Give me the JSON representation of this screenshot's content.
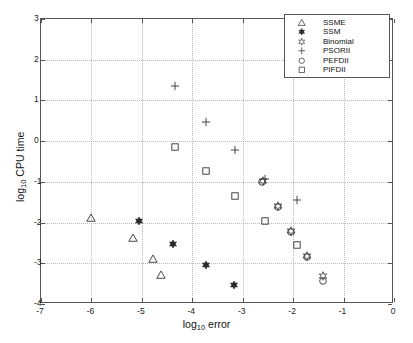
{
  "chart_data": {
    "type": "scatter",
    "title": "",
    "xlabel": "log10 error",
    "ylabel": "log10 CPU time",
    "xlabel_parts": {
      "pre": "log",
      "sub": "10",
      "post": " error"
    },
    "ylabel_parts": {
      "pre": "log",
      "sub": "10",
      "post": " CPU time"
    },
    "xlim": [
      -7,
      0
    ],
    "ylim": [
      -4,
      3
    ],
    "xticks": [
      -7,
      -6,
      -5,
      -4,
      -3,
      -2,
      -1,
      0
    ],
    "xticklabels": [
      "-7",
      "-6",
      "-5",
      "-4",
      "-3",
      "-2",
      "-1",
      "0"
    ],
    "yticks": [
      -4,
      -3,
      -2,
      -1,
      0,
      1,
      2,
      3
    ],
    "yticklabels": [
      "-4",
      "-3",
      "-2",
      "-1",
      "0",
      "1",
      "2",
      "3"
    ],
    "grid": true,
    "grid_style": "dotted",
    "legend_position": "upper right",
    "series": [
      {
        "name": "SSME",
        "marker": "triangle",
        "fill": "none",
        "color": "#333333",
        "points": [
          {
            "x": -6.0,
            "y": -1.89
          },
          {
            "x": -5.18,
            "y": -2.38
          },
          {
            "x": -4.78,
            "y": -2.89
          },
          {
            "x": -4.62,
            "y": -3.29
          }
        ]
      },
      {
        "name": "SSM",
        "marker": "filled-dot",
        "fill": "#2b2b2b",
        "color": "#2b2b2b",
        "points": [
          {
            "x": -5.06,
            "y": -1.97
          },
          {
            "x": -4.38,
            "y": -2.52
          },
          {
            "x": -3.72,
            "y": -3.04
          },
          {
            "x": -3.17,
            "y": -3.54
          }
        ]
      },
      {
        "name": "Binomial",
        "marker": "star",
        "fill": "none",
        "color": "#333333",
        "points": [
          {
            "x": -2.6,
            "y": -0.99
          },
          {
            "x": -2.3,
            "y": -1.6
          },
          {
            "x": -2.04,
            "y": -2.21
          },
          {
            "x": -1.72,
            "y": -2.83
          },
          {
            "x": -1.4,
            "y": -3.32
          }
        ]
      },
      {
        "name": "PSORII",
        "marker": "plus",
        "fill": "none",
        "color": "#333333",
        "points": [
          {
            "x": -4.34,
            "y": 1.35
          },
          {
            "x": -3.72,
            "y": 0.47
          },
          {
            "x": -3.16,
            "y": -0.21
          },
          {
            "x": -2.56,
            "y": -0.93
          },
          {
            "x": -1.92,
            "y": -1.45
          }
        ]
      },
      {
        "name": "PEFDII",
        "marker": "circle",
        "fill": "none",
        "color": "#333333",
        "points": [
          {
            "x": -2.61,
            "y": -1.0
          },
          {
            "x": -2.31,
            "y": -1.61
          },
          {
            "x": -2.05,
            "y": -2.22
          },
          {
            "x": -1.73,
            "y": -2.84
          },
          {
            "x": -1.4,
            "y": -3.44
          }
        ]
      },
      {
        "name": "PIFDII",
        "marker": "square",
        "fill": "none",
        "color": "#333333",
        "points": [
          {
            "x": -4.35,
            "y": -0.14
          },
          {
            "x": -3.72,
            "y": -0.73
          },
          {
            "x": -3.16,
            "y": -1.34
          },
          {
            "x": -2.56,
            "y": -1.96
          },
          {
            "x": -1.93,
            "y": -2.54
          }
        ]
      }
    ]
  },
  "legend": {
    "entries": [
      {
        "label": "SSME",
        "marker": "triangle"
      },
      {
        "label": "SSM",
        "marker": "filled-dot"
      },
      {
        "label": "Binomial",
        "marker": "star"
      },
      {
        "label": "PSORII",
        "marker": "plus"
      },
      {
        "label": "PEFDII",
        "marker": "circle"
      },
      {
        "label": "PIFDII",
        "marker": "square"
      }
    ]
  },
  "colors": {
    "axis": "#555555",
    "grid": "#b9b9b9",
    "marker": "#333333",
    "marker_filled": "#2b2b2b",
    "background": "#ffffff"
  }
}
